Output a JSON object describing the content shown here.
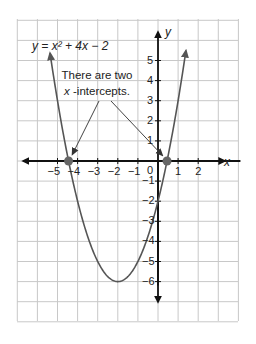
{
  "chart_data": {
    "type": "line",
    "title": "",
    "equation_label": "y = x² + 4x − 2",
    "function": "x^2 + 4x - 2",
    "xlabel": "x",
    "ylabel": "y",
    "xlim": [
      -7,
      4
    ],
    "ylim": [
      -8,
      7
    ],
    "grid": true,
    "x_ticks": [
      -5,
      -4,
      -3,
      -2,
      -1,
      1,
      2
    ],
    "x_tick_labels": [
      "−5",
      "−4",
      "−3",
      "−2",
      "−1",
      "1",
      "2"
    ],
    "y_ticks": [
      5,
      4,
      3,
      2,
      1,
      -1,
      -2,
      -3,
      -4,
      -5,
      -6
    ],
    "y_tick_labels": [
      "5",
      "4",
      "3",
      "2",
      "1",
      "−1",
      "−2",
      "−3",
      "−4",
      "−5",
      "−6"
    ],
    "origin_label": "0",
    "vertex": {
      "x": -2,
      "y": -6
    },
    "x_intercepts": [
      -4.449,
      0.449
    ],
    "y_intercept": -2,
    "curve_domain": [
      -5.37,
      1.39
    ],
    "annotation": {
      "line1": "There are two",
      "line2_var": "x",
      "line2_rest": " -intercepts."
    },
    "colors": {
      "grid": "#c8c8c8",
      "axis": "#111111",
      "curve": "#555555",
      "intercept_dot": "#666666",
      "annotation_arrow": "#444444"
    }
  }
}
